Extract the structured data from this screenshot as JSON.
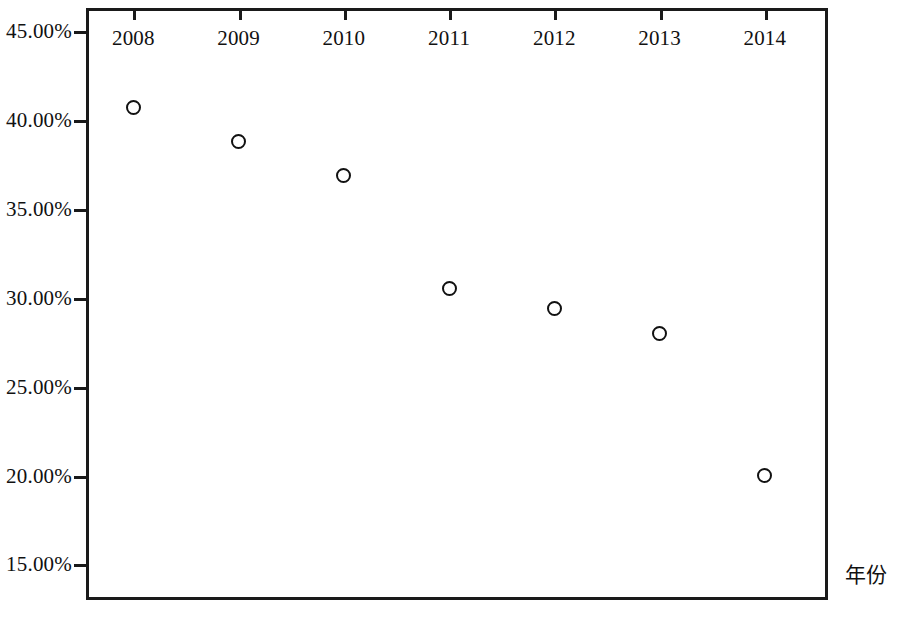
{
  "chart_data": {
    "type": "scatter",
    "title": "",
    "xlabel": "年份",
    "ylabel": "",
    "categories": [
      "2008",
      "2009",
      "2010",
      "2011",
      "2012",
      "2013",
      "2014"
    ],
    "x": [
      2008,
      2009,
      2010,
      2011,
      2012,
      2013,
      2014
    ],
    "values": [
      40.7,
      38.8,
      36.9,
      30.5,
      29.4,
      28.0,
      20.0
    ],
    "series": [
      {
        "name": "",
        "values": [
          40.7,
          38.8,
          36.9,
          30.5,
          29.4,
          28.0,
          20.0
        ]
      }
    ],
    "point_labels": [
      "40.70%",
      "38.80%",
      "36.90%",
      "30.50%",
      "29.40%",
      "28.00%",
      "20.00%"
    ],
    "ylim": [
      13.0,
      46.3
    ],
    "xlim": [
      2007.55,
      2014.6
    ],
    "ytick_values": [
      45.0,
      40.0,
      35.0,
      30.0,
      25.0,
      20.0,
      15.0
    ],
    "ytick_labels": [
      "45.00%",
      "40.00%",
      "35.00%",
      "30.00%",
      "25.00%",
      "20.00%",
      "15.00%"
    ],
    "xtick_labels": [
      "2008",
      "2009",
      "2010",
      "2011",
      "2012",
      "2013",
      "2014"
    ],
    "grid": false,
    "legend": null,
    "marker_style": "open-circle",
    "marker_color": "#111111",
    "frame_color": "#1a1a1a",
    "background_color": "#ffffff"
  },
  "axis_titles": {
    "x": "年份"
  }
}
